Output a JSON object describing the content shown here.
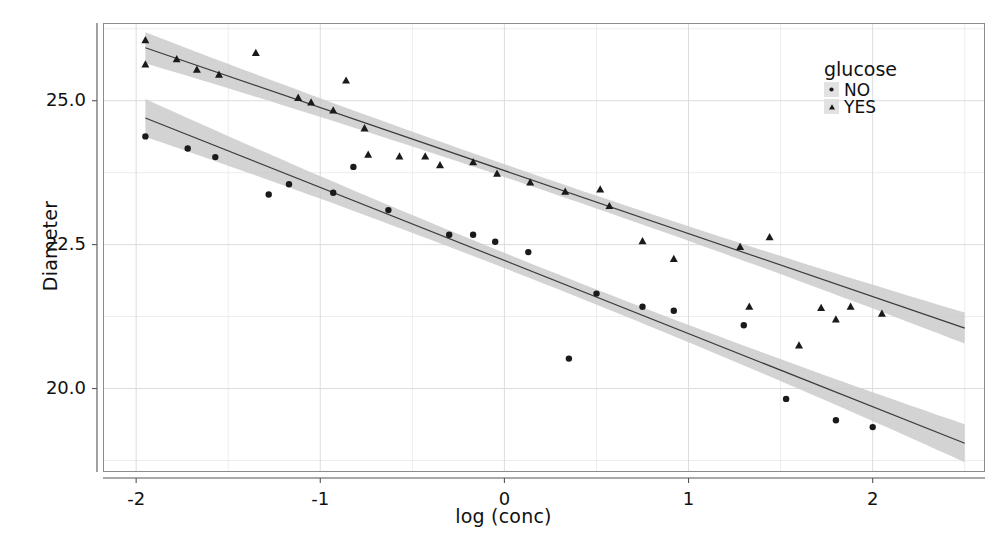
{
  "chart_data": {
    "type": "scatter",
    "title": "",
    "xlabel": "log (conc)",
    "ylabel": "Diameter",
    "xlim": [
      -2.18,
      2.61
    ],
    "ylim": [
      18.55,
      26.35
    ],
    "xticks": [
      -2,
      -1,
      0,
      1,
      2
    ],
    "xtick_labels": [
      "-2",
      "-1",
      "0",
      "1",
      "2"
    ],
    "yticks": [
      20.0,
      22.5,
      25.0
    ],
    "ytick_labels": [
      "20.0",
      "22.5",
      "25.0"
    ],
    "grid": true,
    "grid_minor": true,
    "legend": {
      "title": "glucose",
      "position": "top-right-inside",
      "entries": [
        {
          "label": "NO",
          "marker": "circle"
        },
        {
          "label": "YES",
          "marker": "triangle"
        }
      ]
    },
    "series": [
      {
        "name": "YES",
        "marker": "triangle",
        "color": "#1a1a1a",
        "points": [
          {
            "x": -1.95,
            "y": 26.05
          },
          {
            "x": -1.95,
            "y": 25.63
          },
          {
            "x": -1.78,
            "y": 25.72
          },
          {
            "x": -1.67,
            "y": 25.54
          },
          {
            "x": -1.55,
            "y": 25.45
          },
          {
            "x": -1.35,
            "y": 25.83
          },
          {
            "x": -1.12,
            "y": 25.05
          },
          {
            "x": -1.05,
            "y": 24.97
          },
          {
            "x": -0.93,
            "y": 24.83
          },
          {
            "x": -0.86,
            "y": 25.35
          },
          {
            "x": -0.76,
            "y": 24.52
          },
          {
            "x": -0.74,
            "y": 24.06
          },
          {
            "x": -0.57,
            "y": 24.03
          },
          {
            "x": -0.43,
            "y": 24.03
          },
          {
            "x": -0.35,
            "y": 23.88
          },
          {
            "x": -0.17,
            "y": 23.93
          },
          {
            "x": -0.04,
            "y": 23.73
          },
          {
            "x": 0.14,
            "y": 23.58
          },
          {
            "x": 0.33,
            "y": 23.42
          },
          {
            "x": 0.52,
            "y": 23.46
          },
          {
            "x": 0.57,
            "y": 23.17
          },
          {
            "x": 0.75,
            "y": 22.56
          },
          {
            "x": 0.92,
            "y": 22.25
          },
          {
            "x": 1.28,
            "y": 22.46
          },
          {
            "x": 1.33,
            "y": 21.42
          },
          {
            "x": 1.44,
            "y": 22.63
          },
          {
            "x": 1.6,
            "y": 20.75
          },
          {
            "x": 1.72,
            "y": 21.4
          },
          {
            "x": 1.8,
            "y": 21.2
          },
          {
            "x": 1.88,
            "y": 21.42
          },
          {
            "x": 2.05,
            "y": 21.3
          }
        ]
      },
      {
        "name": "NO",
        "marker": "circle",
        "color": "#1a1a1a",
        "points": [
          {
            "x": -1.95,
            "y": 24.38
          },
          {
            "x": -1.72,
            "y": 24.17
          },
          {
            "x": -1.57,
            "y": 24.02
          },
          {
            "x": -1.28,
            "y": 23.37
          },
          {
            "x": -1.17,
            "y": 23.55
          },
          {
            "x": -0.93,
            "y": 23.4
          },
          {
            "x": -0.82,
            "y": 23.85
          },
          {
            "x": -0.63,
            "y": 23.1
          },
          {
            "x": -0.3,
            "y": 22.67
          },
          {
            "x": -0.17,
            "y": 22.67
          },
          {
            "x": -0.05,
            "y": 22.55
          },
          {
            "x": 0.13,
            "y": 22.37
          },
          {
            "x": 0.35,
            "y": 20.52
          },
          {
            "x": 0.5,
            "y": 21.65
          },
          {
            "x": 0.75,
            "y": 21.42
          },
          {
            "x": 0.92,
            "y": 21.35
          },
          {
            "x": 1.3,
            "y": 21.1
          },
          {
            "x": 1.53,
            "y": 19.82
          },
          {
            "x": 1.8,
            "y": 19.45
          },
          {
            "x": 2.0,
            "y": 19.33
          }
        ]
      }
    ],
    "fits": [
      {
        "name": "YES",
        "type": "linear-regression",
        "x_range": [
          -1.95,
          2.5
        ],
        "y_at_xmin": 25.92,
        "y_at_xmax": 21.05,
        "ci_halfwidth_center": 0.11,
        "ci_halfwidth_ends": 0.27,
        "line_color": "#3b3b3b",
        "band_color": "#c9c9c9"
      },
      {
        "name": "NO",
        "type": "linear-regression",
        "x_range": [
          -1.95,
          2.5
        ],
        "y_at_xmin": 24.7,
        "y_at_xmax": 19.05,
        "ci_halfwidth_center": 0.13,
        "ci_halfwidth_ends": 0.33,
        "line_color": "#3b3b3b",
        "band_color": "#c9c9c9"
      }
    ]
  }
}
